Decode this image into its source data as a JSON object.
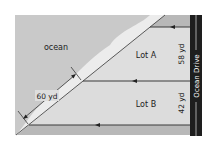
{
  "diagram": {
    "labels": {
      "ocean": "ocean",
      "lot_a": "Lot A",
      "lot_b": "Lot B",
      "lot_a_frontage": "58 yd",
      "lot_b_frontage": "42 yd",
      "lot_a_waterfront": "60 yd",
      "road": "Ocean Drive"
    },
    "colors": {
      "ocean": "#c8c8c8",
      "beach": "#e6e6e6",
      "lots": "#dcdcdc",
      "border_strip": "#b4b4b4",
      "road": "#1e1e1e",
      "road_line": "#ffffff",
      "lines": "#3a3a3a"
    }
  }
}
